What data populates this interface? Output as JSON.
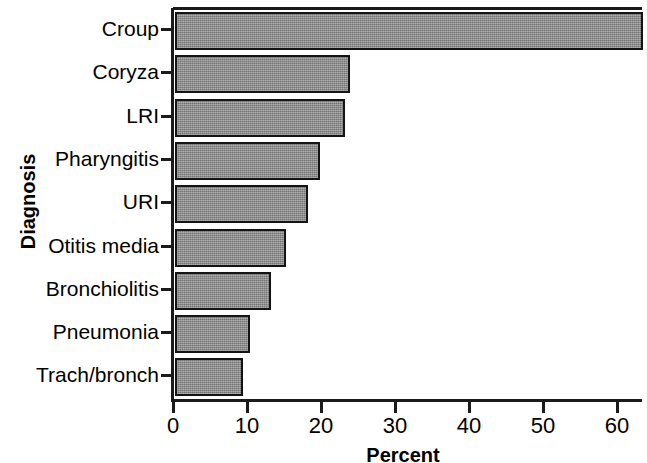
{
  "chart_data": {
    "type": "bar",
    "orientation": "horizontal",
    "title": "",
    "xlabel": "Percent",
    "ylabel": "Diagnosis",
    "categories": [
      "Croup",
      "Coryza",
      "LRI",
      "Pharyngitis",
      "URI",
      "Otitis media",
      "Bronchiolitis",
      "Pneumonia",
      "Trach/bronch"
    ],
    "values": [
      63.3,
      23.6,
      23.0,
      19.6,
      18.0,
      15.0,
      13.0,
      10.1,
      9.2
    ],
    "xlim": [
      0,
      63.4
    ],
    "ylim": null,
    "xticks": [
      0,
      10,
      20,
      30,
      40,
      50,
      60
    ],
    "xtick_labels": [
      "0",
      "10",
      "20",
      "30",
      "40",
      "50",
      "60"
    ],
    "grid": false,
    "legend": null,
    "bar_fill_color": "#8d8d8d",
    "bar_edge_color": "#141414",
    "axis_color": "#1a1a1a"
  },
  "axes": {
    "y_title": "Diagnosis",
    "x_title": "Percent"
  }
}
